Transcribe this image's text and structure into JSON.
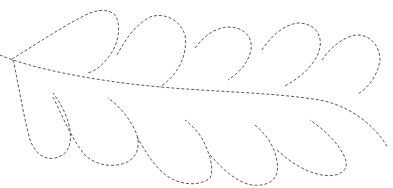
{
  "figure": {
    "background": "#ffffff",
    "stroke_color": "#5a5a5a",
    "stroke_style": "dashed",
    "elements": {
      "spine": "central curved stem running from left point to lower right",
      "top_plumes": 5,
      "bottom_plumes": 5
    }
  }
}
